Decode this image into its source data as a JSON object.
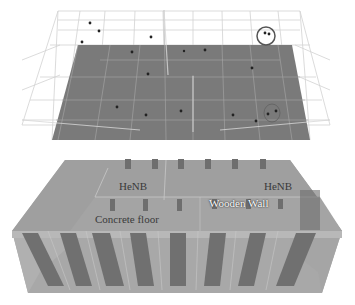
{
  "figure": {
    "top_panel": {
      "description": "Wireframe top view of building floor with HeNB positions",
      "floor_color": "#7a7a7a",
      "wire_color": "#c8c8c8",
      "highlight_circle_color": "#555555",
      "points": [
        {
          "x": 90,
          "y": 23
        },
        {
          "x": 99,
          "y": 31
        },
        {
          "x": 82,
          "y": 42
        },
        {
          "x": 151,
          "y": 37
        },
        {
          "x": 265,
          "y": 33
        },
        {
          "x": 269,
          "y": 34
        },
        {
          "x": 132,
          "y": 52
        },
        {
          "x": 184,
          "y": 51
        },
        {
          "x": 205,
          "y": 50
        },
        {
          "x": 252,
          "y": 68
        },
        {
          "x": 148,
          "y": 74
        },
        {
          "x": 117,
          "y": 107
        },
        {
          "x": 146,
          "y": 115
        },
        {
          "x": 181,
          "y": 111
        },
        {
          "x": 233,
          "y": 115
        },
        {
          "x": 276,
          "y": 111
        },
        {
          "x": 268,
          "y": 114
        },
        {
          "x": 256,
          "y": 121
        }
      ]
    },
    "bottom_panel": {
      "description": "3D rendered building model",
      "labels": {
        "henb_left": "HeNB",
        "henb_right": "HeNB",
        "wooden_wall": "Wooden Wall",
        "concrete_floor": "Concrete floor"
      }
    }
  }
}
